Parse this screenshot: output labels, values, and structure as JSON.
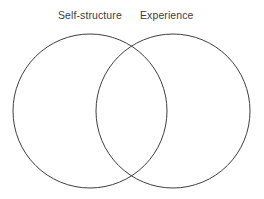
{
  "figure": {
    "type": "venn-diagram",
    "background_color": "#ffffff",
    "stroke_color": "#3f3f3f",
    "stroke_width": 1,
    "text_color": "#3d3d3d"
  },
  "labels": {
    "left": "Self-structure",
    "right": "Experience"
  },
  "circles": [
    {
      "name": "self-structure-circle",
      "label": "Self-structure",
      "cx": 90,
      "cy": 111,
      "r": 77
    },
    {
      "name": "experience-circle",
      "label": "Experience",
      "cx": 173,
      "cy": 111,
      "r": 77
    }
  ],
  "regions": {
    "left_only": "Self-structure",
    "overlap": "",
    "right_only": "Experience"
  }
}
